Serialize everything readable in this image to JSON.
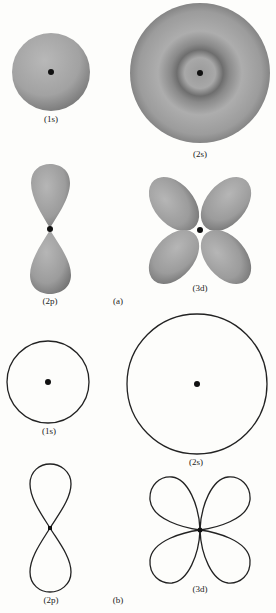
{
  "figure": {
    "part_a": {
      "tag": "(a)",
      "style": "shaded",
      "orbitals": [
        {
          "id": "1s",
          "label": "(1s)"
        },
        {
          "id": "2s",
          "label": "(2s)"
        },
        {
          "id": "2p",
          "label": "(2p)"
        },
        {
          "id": "3d",
          "label": "(3d)"
        }
      ]
    },
    "part_b": {
      "tag": "(b)",
      "style": "outline",
      "orbitals": [
        {
          "id": "1s",
          "label": "(1s)"
        },
        {
          "id": "2s",
          "label": "(2s)"
        },
        {
          "id": "2p",
          "label": "(2p)"
        },
        {
          "id": "3d",
          "label": "(3d)"
        }
      ]
    },
    "colors": {
      "shade_light": "#b4b4b4",
      "shade_dark": "#6e6e6e",
      "outline": "#222222",
      "nucleus": "#111111"
    }
  }
}
